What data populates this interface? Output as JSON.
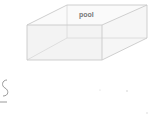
{
  "diagram": {
    "type": "3d-box",
    "label": "pool",
    "colors": {
      "edge": "#c9c9c9",
      "label": "#777777",
      "background": "#ffffff"
    },
    "vertices": {
      "front_top_left": [
        27,
        25
      ],
      "front_top_right": [
        102,
        25
      ],
      "front_bottom_left": [
        27,
        60
      ],
      "front_bottom_right": [
        102,
        60
      ],
      "back_top_left": [
        67,
        5
      ],
      "back_top_right": [
        147,
        5
      ],
      "back_bottom_left": [
        67,
        38
      ],
      "back_bottom_right": [
        147,
        38
      ]
    }
  },
  "fragment": {
    "left_glyph": "S"
  }
}
